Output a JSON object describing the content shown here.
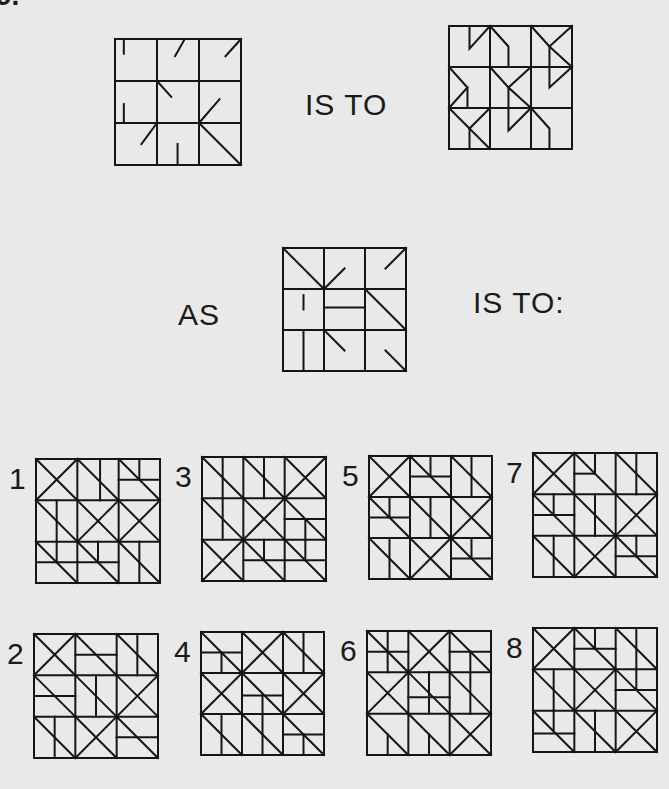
{
  "question": {
    "number_fragment": "9.",
    "connector_1": "IS TO",
    "connector_2": "AS",
    "connector_3": "IS TO:"
  },
  "figures": {
    "A": {
      "pos": [
        114,
        38
      ],
      "size": 126,
      "grid": 3,
      "lines": [
        [
          0.21,
          0,
          0.21,
          0.35
        ],
        [
          1.66,
          0,
          1.43,
          0.41
        ],
        [
          3,
          0,
          2.63,
          0.41
        ],
        [
          1,
          1,
          1.34,
          1.38
        ],
        [
          0.21,
          1.55,
          0.21,
          2
        ],
        [
          2,
          2,
          2.49,
          1.43
        ],
        [
          1,
          2,
          0.63,
          2.5
        ],
        [
          1.49,
          2.5,
          1.49,
          3
        ],
        [
          2,
          2,
          3,
          3
        ]
      ]
    },
    "B": {
      "pos": [
        448,
        25
      ],
      "size": 123,
      "grid": 3,
      "polylines": [
        [
          [
            0.5,
            0
          ],
          [
            0.5,
            0.55
          ],
          [
            1,
            0
          ]
        ],
        [
          [
            1,
            0
          ],
          [
            1.45,
            0.5
          ],
          [
            1.45,
            1
          ],
          [
            1,
            1
          ]
        ],
        [
          [
            2,
            0
          ],
          [
            2.45,
            0.5
          ],
          [
            2.45,
            1
          ]
        ],
        [
          [
            3,
            0
          ],
          [
            2.45,
            0.5
          ],
          [
            3,
            1
          ]
        ],
        [
          [
            3,
            1
          ],
          [
            2.45,
            1.5
          ],
          [
            2.45,
            1
          ]
        ],
        [
          [
            0,
            1
          ],
          [
            0.45,
            1.5
          ],
          [
            0,
            2
          ]
        ],
        [
          [
            0.45,
            1.5
          ],
          [
            0.45,
            2
          ]
        ],
        [
          [
            1,
            1
          ],
          [
            1.45,
            1.5
          ],
          [
            2,
            1
          ]
        ],
        [
          [
            1.45,
            1.5
          ],
          [
            1.45,
            2
          ],
          [
            2,
            2
          ],
          [
            1.45,
            1.5
          ]
        ],
        [
          [
            0,
            2
          ],
          [
            0.5,
            2.5
          ],
          [
            1,
            2
          ]
        ],
        [
          [
            0.5,
            2.5
          ],
          [
            1,
            3
          ]
        ],
        [
          [
            0.5,
            2.5
          ],
          [
            0.5,
            3
          ]
        ],
        [
          [
            1.45,
            2
          ],
          [
            1.45,
            2.55
          ],
          [
            2,
            2
          ]
        ],
        [
          [
            2,
            2
          ],
          [
            2.45,
            2.5
          ],
          [
            2.45,
            3
          ],
          [
            2,
            3
          ]
        ]
      ]
    },
    "C": {
      "pos": [
        282,
        247
      ],
      "size": 123,
      "grid": 3,
      "lines": [
        [
          0,
          0,
          1,
          1
        ],
        [
          1,
          1,
          1.5,
          0.5
        ],
        [
          3,
          0,
          2.5,
          0.5
        ],
        [
          0.5,
          1.15,
          0.5,
          1.5
        ],
        [
          1,
          1.45,
          2,
          1.45
        ],
        [
          2,
          1,
          3,
          2
        ],
        [
          0.5,
          2,
          0.5,
          3
        ],
        [
          1,
          2,
          1.5,
          2.5
        ],
        [
          2.5,
          2.5,
          3,
          3
        ]
      ]
    }
  },
  "options": [
    {
      "id": "1",
      "pos": [
        35,
        458
      ],
      "size": 124,
      "lines": [
        [
          0,
          0,
          1,
          1
        ],
        [
          1,
          0,
          0,
          1
        ],
        [
          1,
          0,
          2,
          1
        ],
        [
          1.55,
          0,
          1.55,
          1
        ],
        [
          2,
          0,
          3,
          1
        ],
        [
          2.5,
          0,
          2.5,
          0.5
        ],
        [
          2,
          0.5,
          3,
          0.5
        ],
        [
          0,
          1,
          1,
          2
        ],
        [
          0.5,
          1,
          0.5,
          2
        ],
        [
          1,
          1,
          2,
          2
        ],
        [
          2,
          1,
          1,
          2
        ],
        [
          2,
          1,
          3,
          2
        ],
        [
          3,
          1,
          2,
          2
        ],
        [
          0,
          2,
          1,
          3
        ],
        [
          0,
          2.5,
          2,
          2.5
        ],
        [
          0.5,
          2,
          0.5,
          2.5
        ],
        [
          1,
          2,
          2,
          3
        ],
        [
          1.5,
          2,
          1.5,
          2.5
        ],
        [
          2,
          2,
          3,
          3
        ],
        [
          2.5,
          2,
          2.5,
          3
        ]
      ]
    },
    {
      "id": "3",
      "pos": [
        201,
        456
      ],
      "size": 124,
      "lines": [
        [
          0,
          0,
          1,
          1
        ],
        [
          0.5,
          0,
          0.5,
          1
        ],
        [
          1,
          0,
          2,
          1
        ],
        [
          1.5,
          0,
          1.5,
          1
        ],
        [
          2,
          0,
          3,
          1
        ],
        [
          3,
          0,
          2,
          1
        ],
        [
          0,
          1,
          1,
          2
        ],
        [
          0.5,
          1,
          0.5,
          2
        ],
        [
          1,
          1,
          2,
          2
        ],
        [
          2,
          1,
          1,
          2
        ],
        [
          2,
          1,
          3,
          2
        ],
        [
          2,
          1.5,
          3,
          1.5
        ],
        [
          2.5,
          1.5,
          2.5,
          2
        ],
        [
          0,
          2,
          1,
          3
        ],
        [
          1,
          2,
          0,
          3
        ],
        [
          1,
          2,
          2,
          3
        ],
        [
          1.5,
          2,
          1.5,
          2.5
        ],
        [
          1,
          2.5,
          3,
          2.5
        ],
        [
          2,
          2,
          3,
          3
        ],
        [
          2.5,
          2,
          2.5,
          2.5
        ]
      ]
    },
    {
      "id": "5",
      "pos": [
        368,
        455
      ],
      "size": 123,
      "lines": [
        [
          0,
          0,
          1,
          1
        ],
        [
          1,
          0,
          0,
          1
        ],
        [
          1,
          0,
          2,
          1
        ],
        [
          1.5,
          0,
          1.5,
          0.5
        ],
        [
          1,
          0.5,
          2,
          0.5
        ],
        [
          2,
          0,
          3,
          1
        ],
        [
          2.5,
          0,
          2.5,
          1
        ],
        [
          0,
          1,
          1,
          2
        ],
        [
          0.5,
          1,
          0.5,
          1.5
        ],
        [
          0,
          1.5,
          1,
          1.5
        ],
        [
          1,
          1,
          2,
          2
        ],
        [
          1.5,
          1,
          1.5,
          2
        ],
        [
          2,
          1,
          3,
          2
        ],
        [
          3,
          1,
          2,
          2
        ],
        [
          0,
          2,
          1,
          3
        ],
        [
          0.5,
          2,
          0.5,
          3
        ],
        [
          1,
          2,
          2,
          3
        ],
        [
          2,
          2,
          1,
          3
        ],
        [
          2,
          2,
          3,
          3
        ],
        [
          2,
          2.5,
          3,
          2.5
        ],
        [
          2.5,
          2,
          2.5,
          2.5
        ]
      ]
    },
    {
      "id": "7",
      "pos": [
        532,
        452
      ],
      "size": 124,
      "lines": [
        [
          0,
          0,
          1,
          1
        ],
        [
          1,
          0,
          0,
          1
        ],
        [
          1,
          0,
          2,
          1
        ],
        [
          1.5,
          0,
          1.5,
          0.5
        ],
        [
          1,
          0.5,
          1.5,
          0.5
        ],
        [
          2,
          0,
          3,
          1
        ],
        [
          2.5,
          0,
          2.5,
          1
        ],
        [
          0,
          1,
          1,
          2
        ],
        [
          0.5,
          1,
          0.5,
          1.5
        ],
        [
          0,
          1.5,
          1,
          1.5
        ],
        [
          1,
          1,
          2,
          2
        ],
        [
          1.5,
          1,
          1.5,
          2
        ],
        [
          2,
          1,
          3,
          2
        ],
        [
          3,
          1,
          2,
          2
        ],
        [
          0,
          2,
          1,
          3
        ],
        [
          0.5,
          2,
          0.5,
          3
        ],
        [
          1,
          2,
          2,
          3
        ],
        [
          2,
          2,
          1,
          3
        ],
        [
          2,
          2,
          3,
          3
        ],
        [
          2,
          2.5,
          3,
          2.5
        ],
        [
          2.5,
          2,
          2.5,
          2.5
        ]
      ]
    },
    {
      "id": "2",
      "pos": [
        33,
        633
      ],
      "size": 124,
      "lines": [
        [
          0,
          0,
          1,
          1
        ],
        [
          1,
          0,
          0,
          1
        ],
        [
          1,
          0,
          2,
          1
        ],
        [
          1,
          0.5,
          2,
          0.5
        ],
        [
          2,
          0,
          3,
          1
        ],
        [
          2.5,
          0,
          2.5,
          1
        ],
        [
          0,
          1,
          1,
          2
        ],
        [
          0,
          1.5,
          1,
          1.5
        ],
        [
          1,
          1,
          2,
          2
        ],
        [
          1.5,
          1,
          1.5,
          2
        ],
        [
          2,
          1,
          3,
          2
        ],
        [
          3,
          1,
          2,
          2
        ],
        [
          0,
          2,
          1,
          3
        ],
        [
          0.5,
          2,
          0.5,
          3
        ],
        [
          1,
          2,
          2,
          3
        ],
        [
          2,
          2,
          1,
          3
        ],
        [
          2,
          2,
          3,
          3
        ],
        [
          2,
          2.5,
          3,
          2.5
        ]
      ]
    },
    {
      "id": "4",
      "pos": [
        200,
        631
      ],
      "size": 123,
      "lines": [
        [
          0,
          0,
          1,
          1
        ],
        [
          0,
          0.5,
          1,
          0.5
        ],
        [
          0.5,
          0.5,
          0.5,
          1
        ],
        [
          1,
          0,
          2,
          1
        ],
        [
          2,
          0,
          1,
          1
        ],
        [
          2,
          0,
          3,
          1
        ],
        [
          2.5,
          0,
          2.5,
          1
        ],
        [
          0,
          1,
          1,
          2
        ],
        [
          1,
          1,
          0,
          2
        ],
        [
          1,
          1,
          2,
          2
        ],
        [
          1,
          1.55,
          2,
          1.55
        ],
        [
          1.5,
          1.55,
          1.5,
          2
        ],
        [
          2,
          1,
          3,
          2
        ],
        [
          3,
          1,
          2,
          2
        ],
        [
          0,
          2,
          1,
          3
        ],
        [
          0.5,
          2,
          0.5,
          3
        ],
        [
          1,
          2,
          2,
          3
        ],
        [
          1.5,
          2,
          1.5,
          3
        ],
        [
          2,
          2,
          3,
          3
        ],
        [
          2,
          2.5,
          3,
          2.5
        ],
        [
          2.5,
          2.5,
          2.5,
          3
        ]
      ]
    },
    {
      "id": "6",
      "pos": [
        366,
        630
      ],
      "size": 124,
      "lines": [
        [
          0,
          0,
          1,
          1
        ],
        [
          0.5,
          0,
          0.5,
          1
        ],
        [
          0,
          0.5,
          1,
          0.5
        ],
        [
          1,
          0,
          2,
          1
        ],
        [
          2,
          0,
          1,
          1
        ],
        [
          2,
          0,
          3,
          1
        ],
        [
          2,
          0.5,
          3,
          0.5
        ],
        [
          2.5,
          0.5,
          2.5,
          1
        ],
        [
          0,
          1,
          1,
          2
        ],
        [
          1,
          1,
          0,
          2
        ],
        [
          1,
          1,
          2,
          2
        ],
        [
          1,
          1.6,
          2,
          1.6
        ],
        [
          1.5,
          1,
          1.5,
          2
        ],
        [
          2,
          1,
          3,
          2
        ],
        [
          2.5,
          1,
          2.5,
          2
        ],
        [
          0,
          2,
          1,
          3
        ],
        [
          0.5,
          2.5,
          0.5,
          3
        ],
        [
          1,
          2,
          2,
          3
        ],
        [
          1.5,
          2.5,
          1.5,
          3
        ],
        [
          2,
          2,
          3,
          3
        ],
        [
          3,
          2,
          2,
          3
        ]
      ]
    },
    {
      "id": "8",
      "pos": [
        532,
        627
      ],
      "size": 124,
      "lines": [
        [
          0,
          0,
          1,
          1
        ],
        [
          1,
          0,
          0,
          1
        ],
        [
          1,
          0,
          2,
          1
        ],
        [
          1.5,
          0,
          1.5,
          0.5
        ],
        [
          1,
          0.5,
          2,
          0.5
        ],
        [
          2,
          0,
          3,
          1
        ],
        [
          2.5,
          0,
          2.5,
          1
        ],
        [
          0,
          1,
          1,
          2
        ],
        [
          0.5,
          1,
          0.5,
          2
        ],
        [
          1,
          1,
          2,
          2
        ],
        [
          2,
          1,
          1,
          2
        ],
        [
          2,
          1,
          3,
          2
        ],
        [
          2,
          1.5,
          3,
          1.5
        ],
        [
          2.5,
          1,
          2.5,
          1.5
        ],
        [
          0,
          2,
          1,
          3
        ],
        [
          0,
          2.55,
          1,
          2.55
        ],
        [
          0.5,
          2,
          0.5,
          2.5
        ],
        [
          1,
          2,
          2,
          3
        ],
        [
          1.5,
          2,
          1.5,
          3
        ],
        [
          2,
          2,
          3,
          3
        ],
        [
          3,
          2,
          2,
          3
        ]
      ]
    }
  ]
}
